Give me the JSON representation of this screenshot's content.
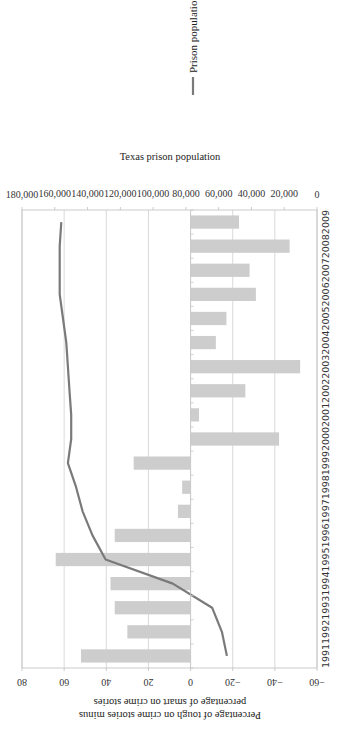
{
  "chart_data": {
    "type": "bar+line",
    "title": "",
    "orientation_note": "figure rotated 90° counter-clockwise",
    "categories": [
      "1991",
      "1992",
      "1993",
      "1994",
      "1995",
      "1996",
      "1997",
      "1998",
      "1999",
      "2000",
      "2001",
      "2002",
      "2003",
      "2004",
      "2005",
      "2006",
      "2007",
      "2008",
      "2009"
    ],
    "series": [
      {
        "name": "Percentage of tough on crime stories minus percentage of smart on crime stories",
        "type": "bar",
        "axis": "left",
        "color": "#cdcdcd",
        "values": [
          52,
          30,
          36,
          38,
          64,
          36,
          6,
          4,
          27,
          -42,
          -4,
          -26,
          -52,
          -12,
          -17,
          -31,
          -28,
          -47,
          -23
        ]
      },
      {
        "name": "Prison population",
        "type": "line",
        "axis": "right",
        "color": "#7a7a7a",
        "values": [
          55000,
          58000,
          64000,
          88000,
          129000,
          137000,
          143000,
          147000,
          152000,
          150000,
          150000,
          151000,
          152000,
          153000,
          155000,
          157000,
          157000,
          157000,
          156000
        ]
      }
    ],
    "xlabel": "",
    "ylabel": "Percentage of tough on crime stories minus percentage of smart on crime stories",
    "ylabel_lines": [
      "Percentage of tough on crime stories minus",
      "percentage of smart on crime stories"
    ],
    "y2label": "Texas prison population",
    "ylim": [
      -60,
      80
    ],
    "y2lim": [
      0,
      180000
    ],
    "yticks": [
      "80",
      "60",
      "40",
      "20",
      "0",
      "−20",
      "−40",
      "−60"
    ],
    "y2ticks": [
      "180,000",
      "160,000",
      "140,000",
      "120,000",
      "100,000",
      "80,000",
      "60,000",
      "40,000",
      "20,000",
      "0"
    ],
    "grid": true,
    "legend": [
      {
        "label": "Prison population",
        "marker": "line",
        "color": "#7a7a7a"
      }
    ],
    "legend_position": "right"
  }
}
